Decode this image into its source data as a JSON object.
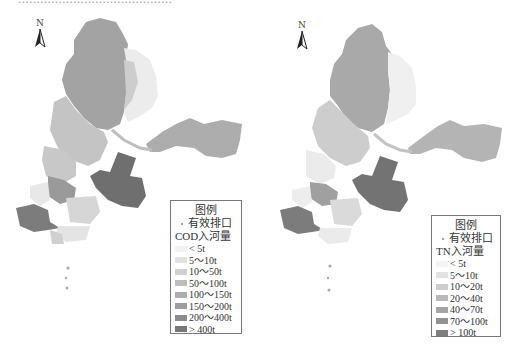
{
  "figure": {
    "caption_clipped": "……………………………………"
  },
  "maps": [
    {
      "id": "cod",
      "north_label": "N",
      "legend": {
        "title": "图例",
        "outlet_label": "有效排口",
        "field_label": "COD入河量",
        "classes": [
          {
            "label": "< 5t",
            "color": "#f2f2f2"
          },
          {
            "label": "5～10t",
            "color": "#e2e2e2"
          },
          {
            "label": "10～50t",
            "color": "#cfcfcf"
          },
          {
            "label": "50～100t",
            "color": "#bdbdbd"
          },
          {
            "label": "100～150t",
            "color": "#adadad"
          },
          {
            "label": "150～200t",
            "color": "#9d9d9d"
          },
          {
            "label": "200～400t",
            "color": "#8c8c8c"
          },
          {
            "label": "> 400t",
            "color": "#777777"
          }
        ]
      }
    },
    {
      "id": "tn",
      "north_label": "N",
      "legend": {
        "title": "图例",
        "outlet_label": "有效排口",
        "field_label": "TN入河量",
        "classes": [
          {
            "label": "< 5t",
            "color": "#f4f4f4"
          },
          {
            "label": "5～10t",
            "color": "#e2e2e2"
          },
          {
            "label": "10～20t",
            "color": "#cdcdcd"
          },
          {
            "label": "20～40t",
            "color": "#b8b8b8"
          },
          {
            "label": "40～70t",
            "color": "#a4a4a4"
          },
          {
            "label": "70～100t",
            "color": "#929292"
          },
          {
            "label": "> 100t",
            "color": "#7e7e7e"
          }
        ]
      }
    }
  ]
}
